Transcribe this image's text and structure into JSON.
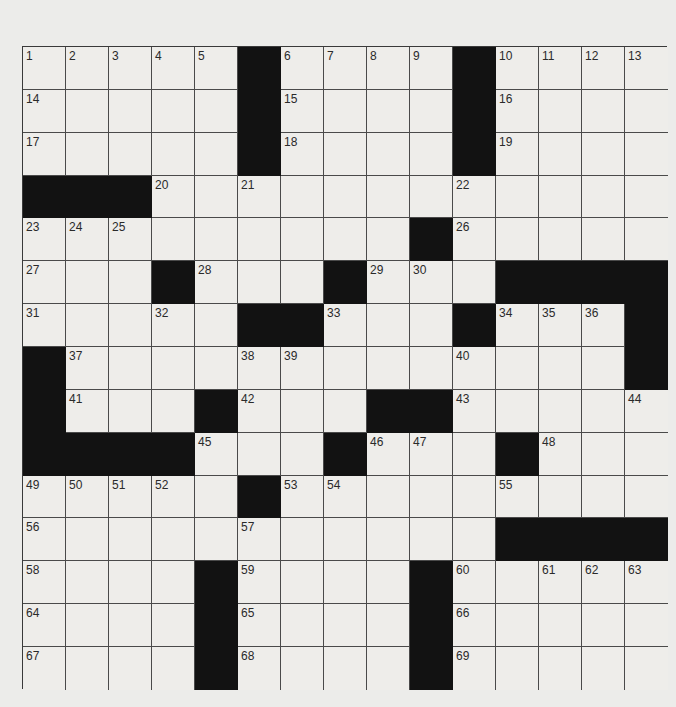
{
  "puzzle": {
    "size": {
      "rows": 15,
      "cols": 15
    },
    "colors": {
      "black_square": "#121212",
      "white_square": "#eeedea",
      "grid_line": "#4a4a4a",
      "background": "#ececea"
    },
    "grid": [
      [
        "1",
        "2",
        "3",
        "4",
        "5",
        "#",
        "6",
        "7",
        "8",
        "9",
        "#",
        "10",
        "11",
        "12",
        "13"
      ],
      [
        "14",
        ".",
        ".",
        ".",
        ".",
        "#",
        "15",
        ".",
        ".",
        ".",
        "#",
        "16",
        ".",
        ".",
        "."
      ],
      [
        "17",
        ".",
        ".",
        ".",
        ".",
        "#",
        "18",
        ".",
        ".",
        ".",
        "#",
        "19",
        ".",
        ".",
        "."
      ],
      [
        "#",
        "#",
        "#",
        "20",
        ".",
        "21",
        ".",
        ".",
        ".",
        ".",
        "22",
        ".",
        ".",
        ".",
        "."
      ],
      [
        "23",
        "24",
        "25",
        ".",
        ".",
        ".",
        ".",
        ".",
        ".",
        "#",
        "26",
        ".",
        ".",
        ".",
        "."
      ],
      [
        "27",
        ".",
        ".",
        "#",
        "28",
        ".",
        ".",
        "#",
        "29",
        "30",
        ".",
        "#",
        "#",
        "#",
        "#"
      ],
      [
        "31",
        ".",
        ".",
        "32",
        ".",
        "#",
        "#",
        "33",
        ".",
        ".",
        "#",
        "34",
        "35",
        "36",
        "#"
      ],
      [
        "#",
        "37",
        ".",
        ".",
        ".",
        "38",
        "39",
        ".",
        ".",
        ".",
        "40",
        ".",
        ".",
        ".",
        "#"
      ],
      [
        "#",
        "41",
        ".",
        ".",
        "#",
        "42",
        ".",
        ".",
        "#",
        "#",
        "43",
        ".",
        ".",
        ".",
        "44"
      ],
      [
        "#",
        "#",
        "#",
        "#",
        "45",
        ".",
        ".",
        "#",
        "46",
        "47",
        ".",
        "#",
        "48",
        ".",
        "."
      ],
      [
        "49",
        "50",
        "51",
        "52",
        ".",
        "#",
        "53",
        "54",
        ".",
        ".",
        ".",
        "55",
        ".",
        ".",
        "."
      ],
      [
        "56",
        ".",
        ".",
        ".",
        ".",
        "57",
        ".",
        ".",
        ".",
        ".",
        ".",
        "#",
        "#",
        "#",
        "#"
      ],
      [
        "58",
        ".",
        ".",
        ".",
        "#",
        "59",
        ".",
        ".",
        ".",
        "#",
        "60",
        ".",
        "61",
        "62",
        "63"
      ],
      [
        "64",
        ".",
        ".",
        ".",
        "#",
        "65",
        ".",
        ".",
        ".",
        "#",
        "66",
        ".",
        ".",
        ".",
        "."
      ],
      [
        "67",
        ".",
        ".",
        ".",
        "#",
        "68",
        ".",
        ".",
        ".",
        "#",
        "69",
        ".",
        ".",
        ".",
        "."
      ]
    ]
  }
}
